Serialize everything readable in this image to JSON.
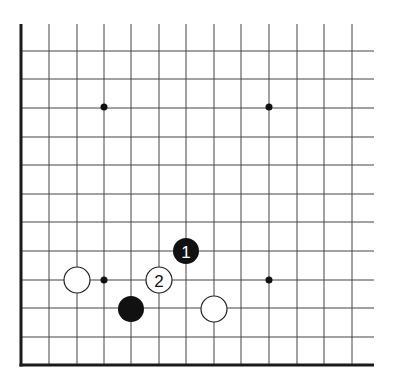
{
  "board": {
    "columns_x": [
      21,
      49,
      77,
      104,
      131,
      159,
      186,
      214,
      241,
      269,
      297,
      324,
      352
    ],
    "rows_y": [
      51,
      79,
      108,
      137,
      165,
      194,
      222,
      251,
      280,
      308,
      337,
      365
    ],
    "top_y": 24,
    "right_x": 374,
    "left_edge_x": 21,
    "bottom_edge_y": 365,
    "line_color": "#444444",
    "edge_color": "#1a1a1a"
  },
  "hoshi": [
    {
      "x": 104,
      "y": 107
    },
    {
      "x": 269,
      "y": 107
    },
    {
      "x": 104,
      "y": 280
    },
    {
      "x": 269,
      "y": 280
    }
  ],
  "stones": [
    {
      "color": "white",
      "x": 77,
      "y": 280,
      "label": ""
    },
    {
      "color": "black",
      "x": 131,
      "y": 309,
      "label": ""
    },
    {
      "color": "white",
      "x": 159,
      "y": 280,
      "label": "2"
    },
    {
      "color": "black",
      "x": 186,
      "y": 251,
      "label": "1"
    },
    {
      "color": "white",
      "x": 214,
      "y": 309,
      "label": ""
    }
  ],
  "stone_radius": 13
}
